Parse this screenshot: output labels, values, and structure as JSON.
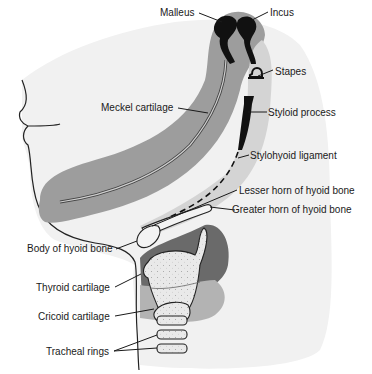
{
  "diagram": {
    "colors": {
      "background": "#ffffff",
      "skin": "#ededed",
      "skin_outline": "#222222",
      "first_arch": "#9a9a9a",
      "second_arch": "#d4d4d4",
      "dark_region": "#6a6a6a",
      "mid_region": "#b0b0b0",
      "cartilage_fill": "#e8e8e8",
      "bone_black": "#111111"
    },
    "labels": {
      "malleus": "Malleus",
      "incus": "Incus",
      "stapes": "Stapes",
      "meckel": "Meckel cartilage",
      "styloid": "Styloid process",
      "stylohyoid": "Stylohyoid ligament",
      "lesser_horn": "Lesser horn of hyoid bone",
      "greater_horn": "Greater horn of hyoid bone",
      "hyoid_body": "Body of hyoid bone",
      "thyroid": "Thyroid cartilage",
      "cricoid": "Cricoid cartilage",
      "tracheal": "Tracheal rings"
    }
  }
}
